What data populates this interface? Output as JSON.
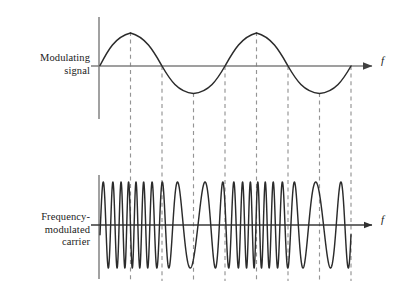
{
  "figure": {
    "background_color": "#ffffff",
    "width": 407,
    "height": 300
  },
  "panels": [
    {
      "id": "modulating-signal",
      "label_lines": [
        "Modulating",
        "signal"
      ],
      "label_text": "Modulating\nsignal",
      "axis_label": "f",
      "axis_label_style": "italic",
      "axis_color": "#808080",
      "curve_color": "#262626",
      "baseline_y": 66,
      "axis_x": 99,
      "axis_top_y": 17,
      "axis_bottom_y": 119,
      "arrow_end_x": 378
    },
    {
      "id": "frequency-modulated-carrier",
      "label_lines": [
        "Frequency-",
        "modulated",
        "carrier"
      ],
      "label_text": "Frequency-\nmodulated\ncarrier",
      "axis_label": "f",
      "axis_label_style": "italic",
      "axis_color": "#404040",
      "curve_color": "#262626",
      "baseline_y": 225,
      "axis_x": 99,
      "axis_top_y": 175,
      "axis_bottom_y": 279,
      "arrow_end_x": 378
    }
  ],
  "guides": {
    "name": "dashed-guide-lines",
    "color": "#909090",
    "dash": "4,3.5",
    "count": 8,
    "x_positions": [
      130.5,
      162.0,
      193.5,
      225.0,
      256.5,
      288.0,
      319.5,
      351.0
    ],
    "top_y": 31,
    "bottom_y": 281
  },
  "chart_data": {
    "type": "line",
    "xlabel": "f",
    "ylabel": "",
    "grid": false,
    "legend": "none",
    "x_start": 100,
    "x_end": 351,
    "series": [
      {
        "name": "Modulating signal",
        "description": "Sinusoid, two full cycles across the plot, zero crossings rising at start",
        "form": "sine",
        "amplitude": 33,
        "cycles": 2,
        "phase_deg": 0,
        "baseline_y": 66,
        "peaks_x": [
          130.5,
          256.5
        ],
        "troughs_x": [
          193.5,
          319.5
        ],
        "zero_crossings_x": [
          100,
          162.0,
          225.0,
          288.0,
          351.0
        ]
      },
      {
        "name": "Frequency-modulated carrier",
        "description": "Constant-amplitude carrier whose instantaneous frequency follows the modulating sinusoid: densest near modulating peaks, sparsest near modulating troughs",
        "form": "fm-carrier",
        "amplitude": 43,
        "baseline_y": 225,
        "carrier_cycles_nominal": 21,
        "modulation_index": 0.62,
        "densest_regions_x": [
          130.5,
          256.5
        ],
        "sparsest_regions_x": [
          193.5,
          319.5
        ]
      }
    ]
  }
}
